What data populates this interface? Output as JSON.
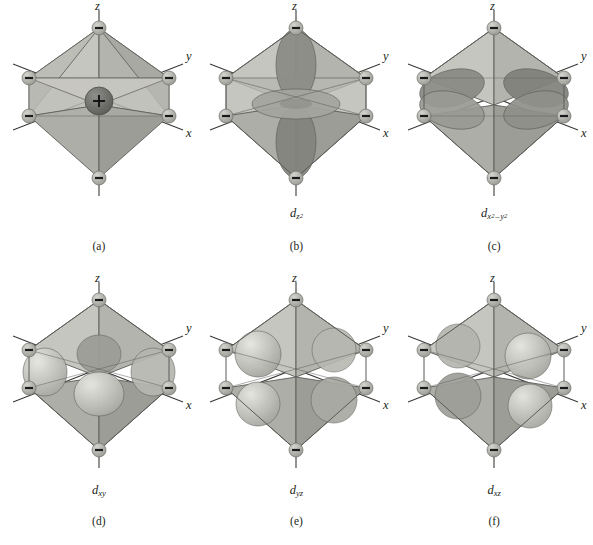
{
  "figure": {
    "background_color": "#ffffff",
    "ink_color": "#231f20"
  },
  "axes": {
    "z_label": "z",
    "y_label": "y",
    "x_label": "x"
  },
  "charges": {
    "metal_center": "+",
    "ligand": "–"
  },
  "colors": {
    "octahedron_face_light": "#c9c9c4",
    "octahedron_face_mid": "#b0b0aa",
    "octahedron_face_dark": "#999993",
    "octahedron_edge": "#4a4a48",
    "orbital_dark": "#8a8a86",
    "orbital_light": "#d8d8d2",
    "ligand_sphere": "#a8a8a2",
    "metal_sphere": "#6e6e6a",
    "axis_line": "#3a3a38"
  },
  "panels": [
    {
      "id": "a",
      "caption": "(a)",
      "orbital_label": null,
      "orbital_type": "none",
      "description": "Octahedral complex: central metal cation with six ligand anions at the vertices",
      "has_metal_center": true
    },
    {
      "id": "b",
      "caption": "(b)",
      "orbital_label": {
        "base": "d",
        "sub": "z",
        "sup": "2"
      },
      "orbital_plain": "dz2",
      "orbital_type": "dz2",
      "description": "d z squared orbital pointing along the z axis toward ligands",
      "has_metal_center": false
    },
    {
      "id": "c",
      "caption": "(c)",
      "orbital_label": {
        "base": "d",
        "sub": "x",
        "sup": "2",
        "sub2": "y",
        "sup2": "2",
        "operator": "–"
      },
      "orbital_plain": "dx2-y2",
      "orbital_type": "dx2y2",
      "description": "d x squared minus y squared orbital with lobes along x and y axes toward ligands",
      "has_metal_center": false
    },
    {
      "id": "d",
      "caption": "(d)",
      "orbital_label": {
        "base": "d",
        "sub": "xy"
      },
      "orbital_plain": "dxy",
      "orbital_type": "dxy",
      "description": "d xy orbital with lobes between the x and y axes",
      "has_metal_center": false
    },
    {
      "id": "e",
      "caption": "(e)",
      "orbital_label": {
        "base": "d",
        "sub": "yz"
      },
      "orbital_plain": "dyz",
      "orbital_type": "dyz",
      "description": "d yz orbital with lobes between the y and z axes",
      "has_metal_center": false
    },
    {
      "id": "f",
      "caption": "(f)",
      "orbital_label": {
        "base": "d",
        "sub": "xz"
      },
      "orbital_plain": "dxz",
      "orbital_type": "dxz",
      "description": "d xz orbital with lobes between the x and z axes",
      "has_metal_center": false
    }
  ]
}
